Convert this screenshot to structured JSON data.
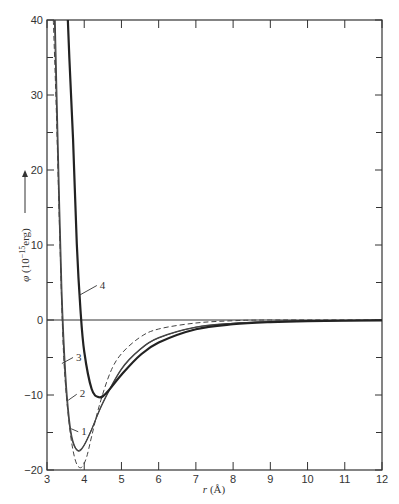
{
  "chart_data": {
    "type": "line",
    "title": "",
    "xlabel": "r (Å)",
    "ylabel": "φ (10⁻¹⁵ erg)",
    "ylabel_arrow": "→",
    "xlim": [
      3,
      12
    ],
    "ylim": [
      -20,
      40
    ],
    "x_ticks": [
      3,
      4,
      5,
      6,
      7,
      8,
      9,
      10,
      11,
      12
    ],
    "y_ticks_major": [
      -20,
      -10,
      0,
      10,
      20,
      30,
      40
    ],
    "y_ticks_minor": [
      -15,
      -5,
      5,
      15,
      25,
      35
    ],
    "grid": false,
    "zero_line": true,
    "legend": "inline numbered labels",
    "series": [
      {
        "name": "1",
        "style": "thin-solid",
        "x": [
          3.22,
          3.3,
          3.4,
          3.5,
          3.6,
          3.7,
          3.85,
          4.0,
          4.2,
          4.5,
          5.0,
          5.5,
          6.0,
          7.0,
          8.0,
          9.0,
          10.0,
          12.0
        ],
        "y": [
          40,
          23.1,
          4.0,
          -7.1,
          -13.2,
          -16.2,
          -17.5,
          -16.7,
          -14.6,
          -11.0,
          -6.5,
          -3.9,
          -2.35,
          -0.95,
          -0.43,
          -0.21,
          -0.11,
          -0.03
        ]
      },
      {
        "name": "2",
        "style": "thin-solid",
        "x": [
          3.2,
          3.28,
          3.38,
          3.48,
          3.58,
          3.68,
          3.83,
          3.98,
          4.18,
          4.5,
          5.0,
          5.5,
          6.0,
          7.0,
          8.0,
          9.0,
          10.0,
          12.0
        ],
        "y": [
          40,
          23.5,
          4.2,
          -7.0,
          -13.1,
          -16.1,
          -17.4,
          -16.8,
          -14.8,
          -11.1,
          -6.6,
          -3.95,
          -2.4,
          -0.97,
          -0.44,
          -0.22,
          -0.12,
          -0.04
        ]
      },
      {
        "name": "3",
        "style": "dashed",
        "x": [
          3.17,
          3.25,
          3.35,
          3.45,
          3.6,
          3.75,
          3.9,
          4.05,
          4.2,
          4.4,
          4.7,
          5.0,
          5.5,
          6.0,
          7.0,
          8.0,
          9.0,
          12.0
        ],
        "y": [
          40,
          28,
          10,
          -5,
          -14,
          -18.5,
          -19.7,
          -18.5,
          -15.5,
          -11.5,
          -7.0,
          -4.5,
          -2.3,
          -1.2,
          -0.4,
          -0.1,
          0,
          0
        ]
      },
      {
        "name": "4",
        "style": "thick-solid",
        "x": [
          3.56,
          3.6,
          3.7,
          3.8,
          3.9,
          4.0,
          4.2,
          4.4,
          4.6,
          5.0,
          5.5,
          6.0,
          7.0,
          8.0,
          9.0,
          10.0,
          12.0
        ],
        "y": [
          40,
          35.0,
          24.1,
          10.2,
          1.3,
          -4.2,
          -9.2,
          -10.3,
          -9.7,
          -7.3,
          -4.7,
          -3.0,
          -1.23,
          -0.57,
          -0.28,
          -0.15,
          -0.05
        ]
      }
    ],
    "annotations": [
      {
        "text": "1",
        "x": 3.92,
        "y": -15.3,
        "points_to": [
          3.65,
          -14.5
        ]
      },
      {
        "text": "2",
        "x": 3.88,
        "y": -10.3,
        "points_to": [
          3.57,
          -10.7
        ]
      },
      {
        "text": "3",
        "x": 3.78,
        "y": -5.4,
        "points_to": [
          3.4,
          -5.8
        ]
      },
      {
        "text": "4",
        "x": 4.42,
        "y": 4.2,
        "points_to": [
          3.87,
          3.3
        ]
      }
    ]
  }
}
